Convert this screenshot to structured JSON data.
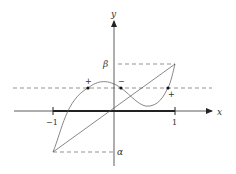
{
  "figure": {
    "axes": {
      "x_label": "x",
      "y_label": "y",
      "x_ticks": [
        {
          "value": -1,
          "label": "−1"
        },
        {
          "value": 1,
          "label": "1"
        }
      ],
      "y_markers": [
        {
          "name": "beta",
          "label": "β"
        },
        {
          "name": "alpha",
          "label": "α"
        }
      ]
    },
    "sign_labels": [
      {
        "label": "+"
      },
      {
        "label": "−"
      },
      {
        "label": "+"
      }
    ],
    "elements": {
      "interval": "[-1, 1] highlighted on x-axis",
      "line": "straight line from (-1, α) to (1, β)",
      "curve": "cubic-like curve from (-1, α) to (1, β)",
      "dashed_horizontal_level": "horizontal dashed line intersecting curve at three marked points"
    },
    "colors": {
      "stroke": "#555555",
      "axis": "#333333",
      "interval": "#222222"
    }
  }
}
